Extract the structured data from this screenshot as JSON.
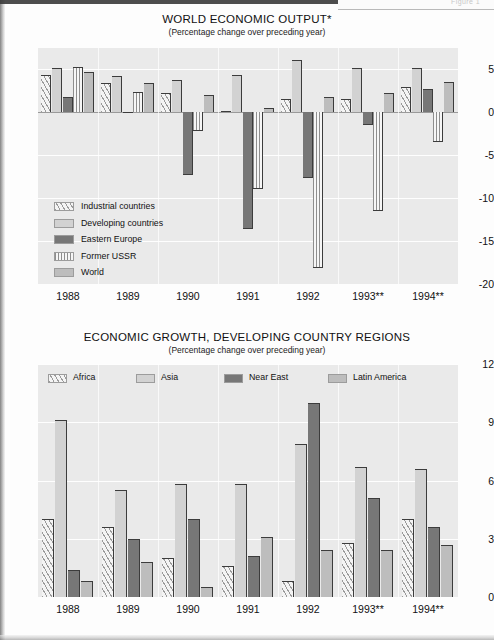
{
  "page": {
    "figure_mark": "Figure 1"
  },
  "charts": [
    {
      "id": "world-economic-output",
      "title": "WORLD ECONOMIC OUTPUT*",
      "subtitle": "(Percentage change over preceding year)"
    },
    {
      "id": "economic-growth-developing-country-regions",
      "title": "ECONOMIC GROWTH, DEVELOPING COUNTRY REGIONS",
      "subtitle": "(Percentage change over preceding year)"
    }
  ],
  "chart_data": [
    {
      "type": "bar",
      "id": "world-economic-output",
      "title": "WORLD ECONOMIC OUTPUT*",
      "subtitle": "(Percentage change over preceding year)",
      "xlabel": "",
      "ylabel": "",
      "ylim": [
        -20,
        7.5
      ],
      "yticks": [
        5,
        0,
        -5,
        -10,
        -15,
        -20
      ],
      "grid": true,
      "legend_position": "inside-lower-left",
      "categories": [
        "1988",
        "1989",
        "1990",
        "1991",
        "1992",
        "1993**",
        "1994**"
      ],
      "series": [
        {
          "name": "Industrial countries",
          "pattern": "diagonal-hatch",
          "color": "#f4f4f4",
          "values": [
            4.4,
            3.4,
            2.2,
            0.2,
            1.5,
            1.6,
            3.0
          ]
        },
        {
          "name": "Developing countries",
          "pattern": "solid",
          "color": "#d2d2d2",
          "values": [
            5.2,
            4.2,
            3.8,
            4.4,
            6.1,
            5.2,
            5.2
          ]
        },
        {
          "name": "Eastern Europe",
          "pattern": "solid",
          "color": "#777777",
          "values": [
            1.8,
            0.1,
            -7.3,
            -13.6,
            -7.6,
            -1.5,
            2.7
          ]
        },
        {
          "name": "Former USSR",
          "pattern": "vertical-stripe",
          "color": "#8e8e8e",
          "values": [
            5.3,
            2.4,
            -2.2,
            -8.9,
            -18.1,
            -11.5,
            -3.5
          ]
        },
        {
          "name": "World",
          "pattern": "solid",
          "color": "#bdbdbd",
          "values": [
            4.7,
            3.4,
            2.0,
            0.5,
            1.8,
            2.2,
            3.5
          ]
        }
      ]
    },
    {
      "type": "bar",
      "id": "economic-growth-developing-country-regions",
      "title": "ECONOMIC GROWTH, DEVELOPING COUNTRY REGIONS",
      "subtitle": "(Percentage change over preceding year)",
      "xlabel": "",
      "ylabel": "",
      "ylim": [
        0,
        12
      ],
      "yticks": [
        12,
        9,
        6,
        3,
        0
      ],
      "grid": true,
      "legend_position": "inside-top",
      "categories": [
        "1988",
        "1989",
        "1990",
        "1991",
        "1992",
        "1993**",
        "1994**"
      ],
      "series": [
        {
          "name": "Africa",
          "pattern": "diagonal-hatch",
          "color": "#f4f4f4",
          "values": [
            4.0,
            3.6,
            2.0,
            1.6,
            0.8,
            2.8,
            4.0
          ]
        },
        {
          "name": "Asia",
          "pattern": "solid",
          "color": "#d2d2d2",
          "values": [
            9.1,
            5.5,
            5.8,
            5.8,
            7.9,
            6.7,
            6.6
          ]
        },
        {
          "name": "Near East",
          "pattern": "solid",
          "color": "#777777",
          "values": [
            1.4,
            3.0,
            4.0,
            2.1,
            10.0,
            5.1,
            3.6
          ]
        },
        {
          "name": "Latin America",
          "pattern": "solid",
          "color": "#bdbdbd",
          "values": [
            0.8,
            1.8,
            0.5,
            3.1,
            2.4,
            2.4,
            2.7
          ]
        }
      ]
    }
  ],
  "colors": {
    "plot_background": "#eaeaea",
    "gridline": "#ffffff",
    "bar_outline": "#3c3c3c",
    "text": "#111111"
  }
}
